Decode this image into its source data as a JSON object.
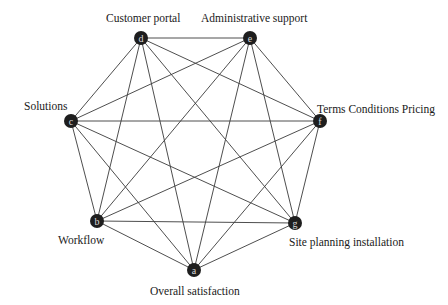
{
  "diagram": {
    "type": "complete-graph",
    "nodes": [
      {
        "id": "a",
        "letter": "a",
        "label": "Overall satisfaction",
        "x": 194,
        "y": 270,
        "label_x": 150,
        "label_y": 286
      },
      {
        "id": "b",
        "letter": "b",
        "label": "Workflow",
        "x": 97,
        "y": 221,
        "label_x": 58,
        "label_y": 235
      },
      {
        "id": "c",
        "letter": "c",
        "label": "Solutions",
        "x": 71,
        "y": 121,
        "label_x": 24,
        "label_y": 101
      },
      {
        "id": "d",
        "letter": "d",
        "label": "Customer portal",
        "x": 141,
        "y": 38,
        "label_x": 106,
        "label_y": 13
      },
      {
        "id": "e",
        "letter": "e",
        "label": "Administrative support",
        "x": 250,
        "y": 38,
        "label_x": 201,
        "label_y": 13
      },
      {
        "id": "f",
        "letter": "f",
        "label": "Terms Conditions Pricing",
        "x": 320,
        "y": 121,
        "label_x": 317,
        "label_y": 104
      },
      {
        "id": "g",
        "letter": "g",
        "label": "Site planning installation",
        "x": 295,
        "y": 223,
        "label_x": 289,
        "label_y": 237
      }
    ],
    "edges": [
      [
        "a",
        "b"
      ],
      [
        "a",
        "c"
      ],
      [
        "a",
        "d"
      ],
      [
        "a",
        "e"
      ],
      [
        "a",
        "f"
      ],
      [
        "a",
        "g"
      ],
      [
        "b",
        "c"
      ],
      [
        "b",
        "d"
      ],
      [
        "b",
        "e"
      ],
      [
        "b",
        "f"
      ],
      [
        "b",
        "g"
      ],
      [
        "c",
        "d"
      ],
      [
        "c",
        "e"
      ],
      [
        "c",
        "f"
      ],
      [
        "c",
        "g"
      ],
      [
        "d",
        "e"
      ],
      [
        "d",
        "f"
      ],
      [
        "d",
        "g"
      ],
      [
        "e",
        "f"
      ],
      [
        "e",
        "g"
      ],
      [
        "f",
        "g"
      ]
    ],
    "node_radius": 7,
    "colors": {
      "node_fill": "#1e1e1e",
      "node_letter": "#d8d8d8",
      "edge": "#3a3a3a",
      "label": "#1a1a1a"
    }
  }
}
